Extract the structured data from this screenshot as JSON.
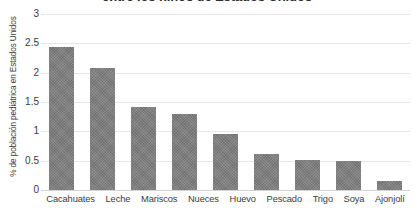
{
  "chart_data": {
    "type": "bar",
    "title": "entre los niños de Estados Unidos",
    "xlabel": "",
    "ylabel": "% de población pediátrica en Estados Unidos",
    "categories": [
      "Cacahuates",
      "Leche",
      "Mariscos",
      "Nueces",
      "Huevo",
      "Pescado",
      "Trigo",
      "Soya",
      "Ajonjolí"
    ],
    "values": [
      2.43,
      2.08,
      1.41,
      1.3,
      0.96,
      0.62,
      0.51,
      0.5,
      0.16
    ],
    "ylim": [
      0,
      3
    ],
    "yticks": [
      0,
      0.5,
      1,
      1.5,
      2,
      2.5,
      3
    ],
    "ytick_labels": [
      "0",
      "0.5",
      "1",
      "1.5",
      "2",
      "2.5",
      "3"
    ],
    "grid": true,
    "legend": false,
    "bar_color": "#7d7d7d",
    "gridline_color": "#e6e6e6",
    "background_color": "#ffffff"
  }
}
